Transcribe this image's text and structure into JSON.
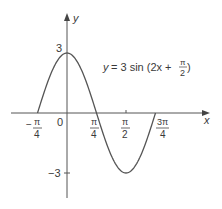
{
  "chart_data": {
    "type": "line",
    "equation": {
      "lhs": "y",
      "rhs_prefix": "= 3 sin (2x +",
      "frac_num": "π",
      "frac_den": "2",
      "rhs_suffix": ")"
    },
    "xlabel": "x",
    "ylabel": "y",
    "x_ticks": [
      {
        "value": -0.7854,
        "sign": "−",
        "num": "π",
        "den": "4"
      },
      {
        "value": 0.7854,
        "sign": "",
        "num": "π",
        "den": "4"
      },
      {
        "value": 1.5708,
        "sign": "",
        "num": "π",
        "den": "2"
      },
      {
        "value": 2.3562,
        "sign": "",
        "num": "3π",
        "den": "4"
      }
    ],
    "origin_label": "0",
    "y_ticks": [
      {
        "value": 3,
        "label": "3"
      },
      {
        "value": -3,
        "label": "−3"
      }
    ],
    "amplitude": 3,
    "frequency": 2,
    "phase": 1.5708,
    "x_range": [
      -0.7854,
      2.3562
    ],
    "ylim": [
      -3,
      3
    ],
    "key_points": [
      {
        "x": -0.7854,
        "y": 0
      },
      {
        "x": 0,
        "y": 3
      },
      {
        "x": 0.7854,
        "y": 0
      },
      {
        "x": 1.5708,
        "y": -3
      },
      {
        "x": 2.3562,
        "y": 0
      }
    ],
    "grid": false,
    "legend": "none",
    "colors": {
      "curve": "#555555",
      "axes": "#555555",
      "text": "#3a3a3a"
    }
  }
}
